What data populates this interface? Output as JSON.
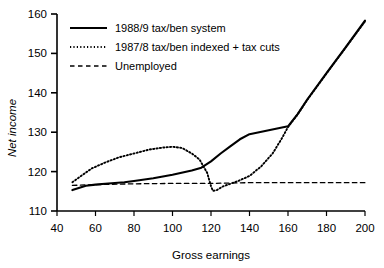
{
  "chart_data": {
    "type": "line",
    "title": "",
    "xlabel": "Gross earnings",
    "ylabel": "Net income",
    "xlim": [
      40,
      200
    ],
    "ylim": [
      110,
      160
    ],
    "xticks": [
      40,
      60,
      80,
      100,
      120,
      140,
      160,
      180,
      200
    ],
    "yticks": [
      110,
      120,
      130,
      140,
      150,
      160
    ],
    "grid": false,
    "legend_position": "top-left",
    "series": [
      {
        "name": "1988/9 tax/ben system",
        "style": "solid",
        "color": "#000000",
        "x": [
          48,
          55,
          60,
          65,
          70,
          75,
          80,
          90,
          100,
          110,
          115,
          120,
          125,
          130,
          135,
          140,
          150,
          160,
          165,
          170,
          180,
          190,
          200
        ],
        "y": [
          115.3,
          116.4,
          116.7,
          116.9,
          117.1,
          117.3,
          117.6,
          118.3,
          119.2,
          120.3,
          121.0,
          122.6,
          124.6,
          126.4,
          128.2,
          129.5,
          130.5,
          131.5,
          134.6,
          138.3,
          145.0,
          151.6,
          158.3
        ]
      },
      {
        "name": "1987/8 tax/ben indexed + tax cuts",
        "style": "dotted",
        "color": "#000000",
        "x": [
          48,
          52,
          58,
          65,
          72,
          80,
          88,
          95,
          100,
          105,
          110,
          114,
          118,
          120,
          121,
          123,
          126,
          130,
          134,
          140,
          146,
          152,
          157,
          160,
          165,
          170,
          180,
          190,
          200
        ],
        "y": [
          117.3,
          118.7,
          120.8,
          122.3,
          123.6,
          124.6,
          125.6,
          126.1,
          126.3,
          126.0,
          124.6,
          123.1,
          119.7,
          116.3,
          115.1,
          115.3,
          116.2,
          116.9,
          117.6,
          118.9,
          121.3,
          124.6,
          128.6,
          131.3,
          134.5,
          138.2,
          144.9,
          151.5,
          158.1
        ]
      },
      {
        "name": "Unemployed",
        "style": "dashed",
        "color": "#000000",
        "x": [
          48,
          60,
          80,
          100,
          120,
          130,
          140,
          160,
          180,
          200
        ],
        "y": [
          116.5,
          116.7,
          116.9,
          117.0,
          117.0,
          117.1,
          117.2,
          117.2,
          117.2,
          117.2
        ]
      }
    ]
  },
  "axes": {
    "y_title": "Net income",
    "x_title": "Gross earnings",
    "x_tick_labels": [
      "40",
      "60",
      "80",
      "100",
      "120",
      "140",
      "160",
      "180",
      "200"
    ],
    "y_tick_labels": [
      "110",
      "120",
      "130",
      "140",
      "150",
      "160"
    ]
  },
  "legend": {
    "items": [
      {
        "label": "1988/9 tax/ben system",
        "style": "solid"
      },
      {
        "label": "1987/8 tax/ben indexed + tax cuts",
        "style": "dotted"
      },
      {
        "label": "Unemployed",
        "style": "dashed"
      }
    ]
  },
  "colors": {
    "ink": "#000000",
    "background": "#ffffff"
  }
}
